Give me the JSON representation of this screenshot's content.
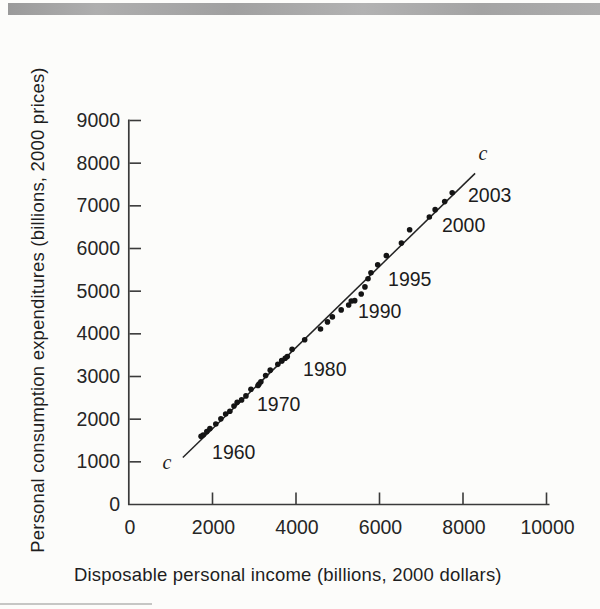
{
  "figure": {
    "top_bar_color": "#a6a6a6",
    "background": "#fcfcfa"
  },
  "chart_data": {
    "type": "scatter",
    "title": "",
    "xlabel": "Disposable personal income (billions, 2000 dollars)",
    "ylabel": "Personal consumption expenditures (billions, 2000 prices)",
    "xlim": [
      0,
      10000
    ],
    "ylim": [
      0,
      9000
    ],
    "xticks": [
      0,
      2000,
      4000,
      6000,
      8000,
      10000
    ],
    "yticks": [
      0,
      1000,
      2000,
      3000,
      4000,
      5000,
      6000,
      7000,
      8000,
      9000
    ],
    "grid": false,
    "legend": null,
    "point_color": "#141414",
    "axis_color": "#3a3a3a",
    "line_color": "#232323",
    "series": [
      {
        "name": "Consumption vs disposable income, annual points 1960-2003",
        "points": [
          {
            "year": 1960,
            "x": 1726,
            "y": 1597
          },
          {
            "year": 1961,
            "x": 1777,
            "y": 1630
          },
          {
            "year": 1962,
            "x": 1864,
            "y": 1711
          },
          {
            "year": 1963,
            "x": 1938,
            "y": 1782
          },
          {
            "year": 1964,
            "x": 2079,
            "y": 1888
          },
          {
            "year": 1965,
            "x": 2201,
            "y": 2007
          },
          {
            "year": 1966,
            "x": 2315,
            "y": 2121
          },
          {
            "year": 1967,
            "x": 2416,
            "y": 2185
          },
          {
            "year": 1968,
            "x": 2514,
            "y": 2310
          },
          {
            "year": 1969,
            "x": 2591,
            "y": 2396
          },
          {
            "year": 1970,
            "x": 2697,
            "y": 2452
          },
          {
            "year": 1971,
            "x": 2801,
            "y": 2545
          },
          {
            "year": 1972,
            "x": 2921,
            "y": 2701
          },
          {
            "year": 1973,
            "x": 3115,
            "y": 2822
          },
          {
            "year": 1974,
            "x": 3090,
            "y": 2790
          },
          {
            "year": 1975,
            "x": 3159,
            "y": 2877
          },
          {
            "year": 1976,
            "x": 3273,
            "y": 3022
          },
          {
            "year": 1977,
            "x": 3383,
            "y": 3149
          },
          {
            "year": 1978,
            "x": 3565,
            "y": 3285
          },
          {
            "year": 1979,
            "x": 3660,
            "y": 3365
          },
          {
            "year": 1980,
            "x": 3658,
            "y": 3374
          },
          {
            "year": 1981,
            "x": 3741,
            "y": 3426
          },
          {
            "year": 1982,
            "x": 3791,
            "y": 3470
          },
          {
            "year": 1983,
            "x": 3907,
            "y": 3640
          },
          {
            "year": 1984,
            "x": 4208,
            "y": 3863
          },
          {
            "year": 1985,
            "x": 4587,
            "y": 4113
          },
          {
            "year": 1986,
            "x": 4754,
            "y": 4280
          },
          {
            "year": 1987,
            "x": 4871,
            "y": 4397
          },
          {
            "year": 1988,
            "x": 5082,
            "y": 4561
          },
          {
            "year": 1989,
            "x": 5261,
            "y": 4675
          },
          {
            "year": 1990,
            "x": 5324,
            "y": 4770
          },
          {
            "year": 1991,
            "x": 5406,
            "y": 4778
          },
          {
            "year": 1992,
            "x": 5562,
            "y": 4935
          },
          {
            "year": 1993,
            "x": 5651,
            "y": 5100
          },
          {
            "year": 1994,
            "x": 5725,
            "y": 5291
          },
          {
            "year": 1995,
            "x": 5795,
            "y": 5433
          },
          {
            "year": 1996,
            "x": 5957,
            "y": 5619
          },
          {
            "year": 1997,
            "x": 6164,
            "y": 5832
          },
          {
            "year": 1998,
            "x": 6525,
            "y": 6126
          },
          {
            "year": 1999,
            "x": 6722,
            "y": 6439
          },
          {
            "year": 2000,
            "x": 7194,
            "y": 6739
          },
          {
            "year": 2001,
            "x": 7333,
            "y": 6910
          },
          {
            "year": 2002,
            "x": 7562,
            "y": 7099
          },
          {
            "year": 2003,
            "x": 7742,
            "y": 7307
          }
        ]
      }
    ],
    "regression_line": {
      "label": "c",
      "x1": 1290,
      "y1": 1100,
      "x2": 8290,
      "y2": 7760
    },
    "line_labels": [
      {
        "text": "c",
        "x": 910,
        "y": 985
      },
      {
        "text": "c",
        "x": 8480,
        "y": 8250
      }
    ],
    "year_annotations": [
      {
        "text": "1960",
        "x": 1990,
        "y": 1220
      },
      {
        "text": "1970",
        "x": 3065,
        "y": 2345
      },
      {
        "text": "1980",
        "x": 4170,
        "y": 3165
      },
      {
        "text": "1990",
        "x": 5485,
        "y": 4525
      },
      {
        "text": "1995",
        "x": 6205,
        "y": 5275
      },
      {
        "text": "2000",
        "x": 7495,
        "y": 6560
      },
      {
        "text": "2003",
        "x": 8120,
        "y": 7265
      }
    ]
  }
}
